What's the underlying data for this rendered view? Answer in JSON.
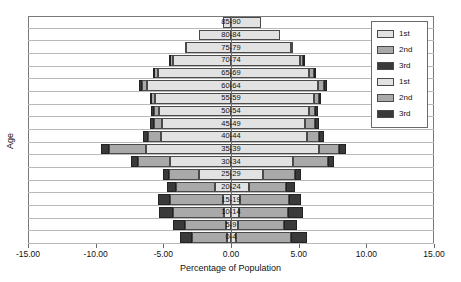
{
  "chart_data": {
    "type": "bar",
    "subtype": "population-pyramid-stacked",
    "title": "",
    "xlabel": "Percentage of Population",
    "ylabel": "Age",
    "xlim": [
      -15.0,
      15.0
    ],
    "xticks": [
      -15.0,
      -10.0,
      -5.0,
      0.0,
      5.0,
      10.0,
      15.0
    ],
    "xticklabels": [
      "-15.00",
      "-10.00",
      "-5.00",
      "0.00",
      "5.00",
      "10.00",
      "15.00"
    ],
    "grid": false,
    "legend_position": "top-right",
    "legend": [
      {
        "label": "1st",
        "color": "#e2e2e2",
        "side": "left"
      },
      {
        "label": "2nd",
        "color": "#a9a9a9",
        "side": "left"
      },
      {
        "label": "3rd",
        "color": "#3a3a3a",
        "side": "left"
      },
      {
        "label": "1st",
        "color": "#e2e2e2",
        "side": "right"
      },
      {
        "label": "2nd",
        "color": "#a9a9a9",
        "side": "right"
      },
      {
        "label": "3rd",
        "color": "#3a3a3a",
        "side": "right"
      }
    ],
    "categories": [
      "85-90",
      "80-84",
      "75-79",
      "70-74",
      "65-69",
      "60-64",
      "55-59",
      "50-54",
      "45-49",
      "40-44",
      "35-39",
      "30-34",
      "25-29",
      "20-24",
      "15-19",
      "10-14",
      "5-9",
      "0-4"
    ],
    "series": [
      {
        "name": "1st (left)",
        "side": "left",
        "color": "#e2e2e2",
        "values": [
          0.6,
          2.4,
          3.3,
          4.3,
          5.4,
          6.2,
          5.6,
          5.3,
          5.1,
          5.2,
          6.3,
          4.5,
          2.4,
          1.2,
          0.6,
          0.5,
          0.4,
          0.3
        ]
      },
      {
        "name": "2nd (left)",
        "side": "left",
        "color": "#a9a9a9",
        "values": [
          0.0,
          0.0,
          0.1,
          0.2,
          0.3,
          0.4,
          0.3,
          0.4,
          0.6,
          0.9,
          2.7,
          2.4,
          2.2,
          2.9,
          3.9,
          3.8,
          3.0,
          2.6
        ]
      },
      {
        "name": "3rd (left)",
        "side": "left",
        "color": "#3a3a3a",
        "values": [
          0.0,
          0.0,
          0.0,
          0.1,
          0.1,
          0.2,
          0.1,
          0.2,
          0.3,
          0.4,
          0.6,
          0.5,
          0.4,
          0.6,
          0.9,
          1.0,
          0.9,
          0.9
        ]
      },
      {
        "name": "1st (right)",
        "side": "right",
        "color": "#e2e2e2",
        "values": [
          2.2,
          3.6,
          4.4,
          5.1,
          5.8,
          6.4,
          6.1,
          5.8,
          5.5,
          5.6,
          6.5,
          4.6,
          2.4,
          1.3,
          0.7,
          0.6,
          0.5,
          0.4
        ]
      },
      {
        "name": "2nd (right)",
        "side": "right",
        "color": "#a9a9a9",
        "values": [
          0.0,
          0.0,
          0.1,
          0.2,
          0.3,
          0.5,
          0.4,
          0.4,
          0.7,
          0.9,
          1.5,
          2.6,
          2.3,
          2.8,
          3.6,
          3.6,
          3.4,
          4.0
        ]
      },
      {
        "name": "3rd (right)",
        "side": "right",
        "color": "#3a3a3a",
        "values": [
          0.0,
          0.0,
          0.0,
          0.1,
          0.1,
          0.2,
          0.1,
          0.2,
          0.3,
          0.4,
          0.5,
          0.4,
          0.5,
          0.6,
          0.9,
          1.1,
          1.0,
          1.2
        ]
      }
    ]
  },
  "axis": {
    "x_title": "Percentage of Population",
    "y_title": "Age"
  }
}
